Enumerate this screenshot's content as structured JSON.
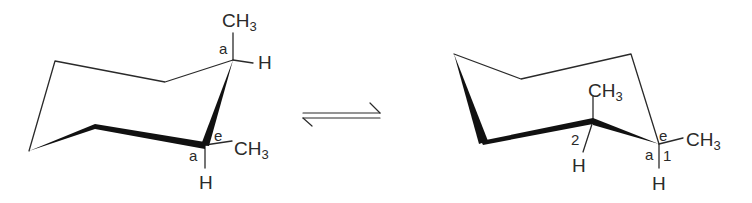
{
  "diagram": {
    "left_chair": {
      "labels": {
        "top_methyl": "CH",
        "top_methyl_sub": "3",
        "top_axial_tag": "a",
        "top_h": "H",
        "bottom_eq_tag": "e",
        "bottom_methyl": "CH",
        "bottom_methyl_sub": "3",
        "bottom_axial_tag": "a",
        "bottom_h": "H"
      }
    },
    "equilibrium_arrow": "⇌",
    "right_chair": {
      "labels": {
        "c2_methyl": "CH",
        "c2_methyl_sub": "3",
        "c2_number": "2",
        "c2_h": "H",
        "c1_eq_tag": "e",
        "c1_methyl": "CH",
        "c1_methyl_sub": "3",
        "c1_axial_tag": "a",
        "c1_number": "1",
        "c1_h": "H"
      }
    },
    "colors": {
      "stroke": "#2a2a2a",
      "background": "#ffffff"
    }
  }
}
